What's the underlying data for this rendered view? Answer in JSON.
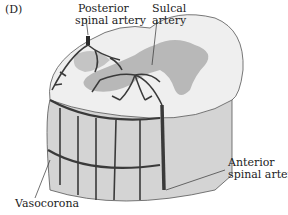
{
  "figure": {
    "panel_label": "(D)",
    "labels": {
      "posterior_line1": "Posterior",
      "posterior_line2": "spinal artery",
      "sulcal_line1": "Sulcal",
      "sulcal_line2": "artery",
      "anterior_line1": "Anterior",
      "anterior_line2": "spinal artery",
      "vasocorona": "Vasocorona"
    },
    "colors": {
      "white_matter": "#f0f0f0",
      "gray_matter": "#b5b5b5",
      "cord_side": "#d6d6d6",
      "artery": "#3a3a3a",
      "leader_line": "#333333"
    }
  }
}
